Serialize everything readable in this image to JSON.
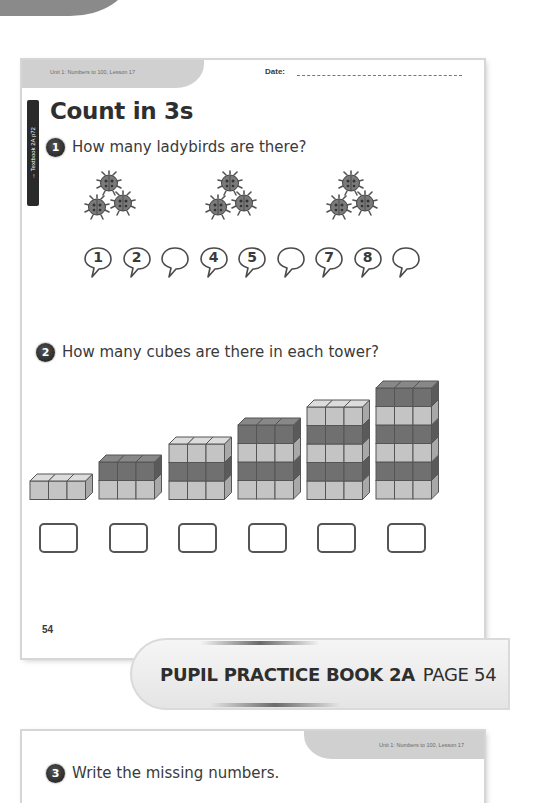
{
  "page1": {
    "unit_label": "Unit 1: Numbers to 100, Lesson 17",
    "date_label": "Date:",
    "side_tab": "→ Textbook 2A p72",
    "title": "Count in 3s",
    "questions": [
      {
        "number": "1",
        "text": "How many ladybirds are there?",
        "ladybird_groups": [
          3,
          3,
          3
        ],
        "bubbles": [
          "1",
          "2",
          "",
          "4",
          "5",
          "",
          "7",
          "8",
          ""
        ]
      },
      {
        "number": "2",
        "text": "How many cubes are there in each tower?",
        "towers": [
          {
            "layers": 1,
            "cubes_per_layer": 3
          },
          {
            "layers": 2,
            "cubes_per_layer": 3
          },
          {
            "layers": 3,
            "cubes_per_layer": 3
          },
          {
            "layers": 4,
            "cubes_per_layer": 3
          },
          {
            "layers": 5,
            "cubes_per_layer": 3
          },
          {
            "layers": 6,
            "cubes_per_layer": 3
          }
        ],
        "answer_boxes": [
          "",
          "",
          "",
          "",
          "",
          ""
        ]
      }
    ],
    "page_number": "54"
  },
  "banner": {
    "book": "PUPIL PRACTICE BOOK 2A",
    "page": "PAGE 54"
  },
  "page2": {
    "unit_label": "Unit 1: Numbers to 100, Lesson 17",
    "question": {
      "number": "3",
      "text": "Write the missing numbers."
    }
  },
  "colors": {
    "cube_light": "#c4c4c4",
    "cube_dark": "#707070",
    "header_tab": "#d0d0d0",
    "ink": "#3a3a3a"
  }
}
